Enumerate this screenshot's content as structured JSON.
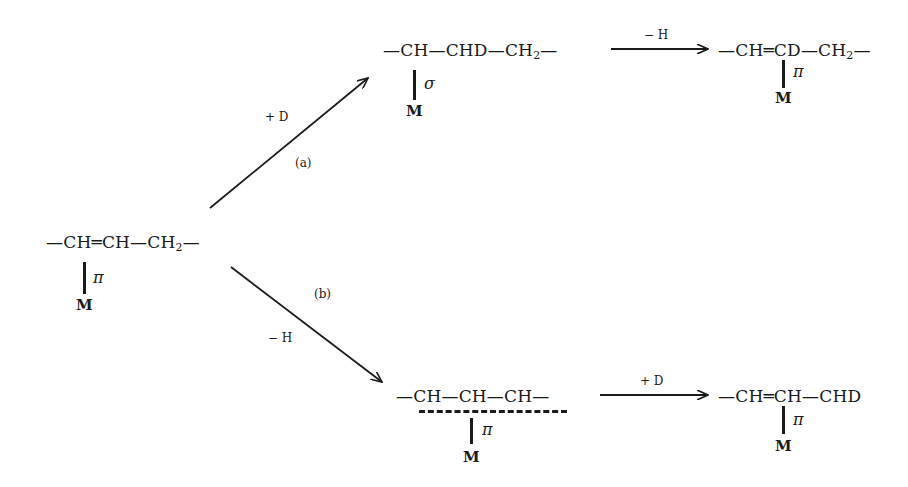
{
  "diagram": {
    "type": "reaction-scheme",
    "start": {
      "formula_parts": [
        "—CH",
        "═",
        "CH—CH",
        "2",
        "—"
      ],
      "bond_label": "π",
      "metal": "M"
    },
    "path_a": {
      "label": "(a)",
      "reagent": "+ D",
      "intermediate": {
        "formula_parts": [
          "—CH—CHD—CH",
          "2",
          "—"
        ],
        "bond_label": "σ",
        "metal": "M"
      },
      "step2_reagent": "− H",
      "product": {
        "formula_parts": [
          "—CH═CD—CH",
          "2",
          "—"
        ],
        "bond_label": "π",
        "metal": "M"
      }
    },
    "path_b": {
      "label": "(b)",
      "reagent": "− H",
      "intermediate": {
        "formula_parts": [
          "—CH—CH—CH—"
        ],
        "bond_label": "π",
        "metal": "M"
      },
      "step2_reagent": "+ D",
      "product": {
        "formula_parts": [
          "—CH═CH—CHD"
        ],
        "bond_label": "π",
        "metal": "M"
      }
    }
  }
}
